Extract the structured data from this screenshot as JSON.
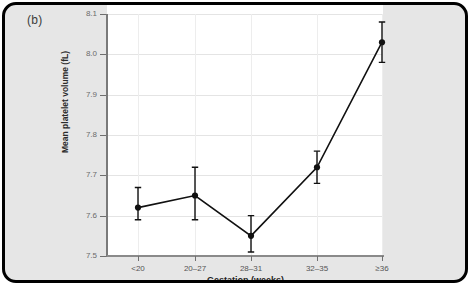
{
  "figure": {
    "panel_label": "(b)",
    "background_color": "#e6e6e6",
    "plot_background_color": "#ffffff",
    "border_color": "#000000"
  },
  "chart_data": {
    "type": "line",
    "title": "",
    "subtitle": "",
    "xlabel": "Gestation (weeks)",
    "ylabel": "Mean platelet volume (fL)",
    "categories": [
      "<20",
      "20–27",
      "28–31",
      "32–35",
      "≥36"
    ],
    "values": [
      7.62,
      7.65,
      7.55,
      7.72,
      8.03
    ],
    "errors_low": [
      7.59,
      7.59,
      7.51,
      7.68,
      7.98
    ],
    "errors_high": [
      7.67,
      7.72,
      7.6,
      7.76,
      8.08
    ],
    "ylim": [
      7.5,
      8.1
    ],
    "yticks": [
      "7.5",
      "7.6",
      "7.7",
      "7.8",
      "7.9",
      "8.0",
      "8.1"
    ],
    "ytick_values": [
      7.5,
      7.6,
      7.7,
      7.8,
      7.9,
      8.0,
      8.1
    ],
    "grid": true,
    "legend": "none",
    "marker": "filled-circle",
    "series_color": "#111111",
    "grid_color": "#e4e4e4",
    "error_bar_style": "capped-vertical"
  }
}
